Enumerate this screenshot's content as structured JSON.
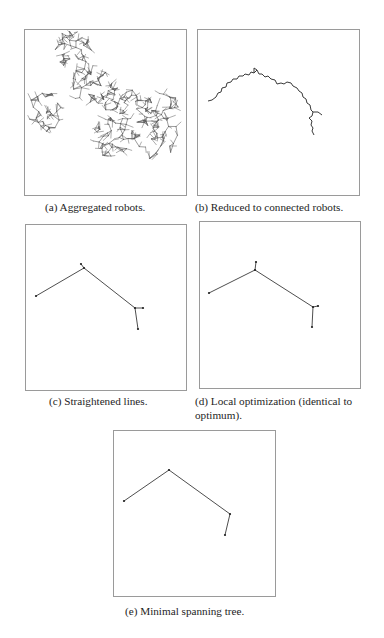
{
  "figure": {
    "panels": [
      {
        "id": "a",
        "caption": "(a) Aggregated robots.",
        "box": {
          "x": 24,
          "y": 29,
          "w": 163,
          "h": 167
        },
        "caption_pos": {
          "x": 45,
          "y": 200
        },
        "network": {
          "seed": 7,
          "clusters": [
            {
              "cx": 72,
              "cy": 50,
              "rx": 20,
              "ry": 20,
              "n": 45
            },
            {
              "cx": 90,
              "cy": 85,
              "rx": 22,
              "ry": 20,
              "n": 50
            },
            {
              "cx": 45,
              "cy": 112,
              "rx": 18,
              "ry": 20,
              "n": 38
            },
            {
              "cx": 120,
              "cy": 105,
              "rx": 22,
              "ry": 18,
              "n": 45
            },
            {
              "cx": 150,
              "cy": 135,
              "rx": 30,
              "ry": 25,
              "n": 70
            },
            {
              "cx": 110,
              "cy": 140,
              "rx": 18,
              "ry": 22,
              "n": 38
            },
            {
              "cx": 160,
              "cy": 105,
              "rx": 20,
              "ry": 12,
              "n": 25
            }
          ]
        }
      },
      {
        "id": "b",
        "caption": "(b) Reduced to connected robots.",
        "box": {
          "x": 197,
          "y": 29,
          "w": 163,
          "h": 167
        },
        "caption_pos": {
          "x": 195,
          "y": 200
        },
        "path": [
          [
            208,
            101
          ],
          [
            212,
            100
          ],
          [
            216,
            97
          ],
          [
            218,
            93
          ],
          [
            221,
            92
          ],
          [
            222,
            88
          ],
          [
            226,
            87
          ],
          [
            227,
            83
          ],
          [
            231,
            82
          ],
          [
            233,
            79
          ],
          [
            237,
            79
          ],
          [
            239,
            76
          ],
          [
            243,
            76
          ],
          [
            245,
            74
          ],
          [
            249,
            75
          ],
          [
            251,
            72
          ],
          [
            254,
            73
          ],
          [
            257,
            70
          ],
          [
            259,
            74
          ],
          [
            262,
            74
          ],
          [
            265,
            77
          ],
          [
            268,
            76
          ],
          [
            271,
            79
          ],
          [
            275,
            80
          ],
          [
            277,
            84
          ],
          [
            281,
            83
          ],
          [
            284,
            84
          ],
          [
            287,
            82
          ],
          [
            291,
            83
          ],
          [
            293,
            86
          ],
          [
            297,
            88
          ],
          [
            299,
            91
          ],
          [
            302,
            93
          ],
          [
            303,
            97
          ],
          [
            306,
            99
          ],
          [
            307,
            103
          ],
          [
            310,
            105
          ],
          [
            311,
            110
          ],
          [
            313,
            112
          ],
          [
            312,
            116
          ],
          [
            309,
            118
          ],
          [
            312,
            121
          ],
          [
            311,
            125
          ],
          [
            313,
            128
          ],
          [
            312,
            131
          ],
          [
            314,
            135
          ]
        ],
        "branches": [
          [
            [
              254,
              73
            ],
            [
              254,
              68
            ],
            [
              257,
              70
            ]
          ],
          [
            [
              313,
              112
            ],
            [
              318,
              112
            ],
            [
              322,
              115
            ]
          ]
        ]
      },
      {
        "id": "c",
        "caption": "(c) Straightened lines.",
        "box": {
          "x": 25,
          "y": 224,
          "w": 162,
          "h": 167
        },
        "caption_pos": {
          "x": 49,
          "y": 394
        },
        "edges": [
          [
            [
              36,
              296
            ],
            [
              84,
              268
            ]
          ],
          [
            [
              81,
              264
            ],
            [
              84,
              268
            ]
          ],
          [
            [
              84,
              268
            ],
            [
              135,
              308
            ]
          ],
          [
            [
              135,
              308
            ],
            [
              143,
              308
            ]
          ],
          [
            [
              135,
              308
            ],
            [
              138,
              329
            ]
          ]
        ],
        "nodes": [
          [
            36,
            296
          ],
          [
            81,
            264
          ],
          [
            84,
            268
          ],
          [
            135,
            308
          ],
          [
            143,
            308
          ],
          [
            138,
            329
          ]
        ]
      },
      {
        "id": "d",
        "caption": "(d) Local optimization (identical to optimum).",
        "box": {
          "x": 199,
          "y": 221,
          "w": 162,
          "h": 168
        },
        "caption_pos": {
          "x": 195,
          "y": 394
        },
        "edges": [
          [
            [
              209,
              293
            ],
            [
              255,
              270
            ]
          ],
          [
            [
              255,
              270
            ],
            [
              256,
              262
            ]
          ],
          [
            [
              255,
              270
            ],
            [
              313,
              307
            ]
          ],
          [
            [
              313,
              307
            ],
            [
              318,
              306
            ]
          ],
          [
            [
              313,
              307
            ],
            [
              312,
              327
            ]
          ]
        ],
        "nodes": [
          [
            209,
            293
          ],
          [
            256,
            262
          ],
          [
            255,
            270
          ],
          [
            313,
            307
          ],
          [
            318,
            306
          ],
          [
            312,
            327
          ]
        ]
      },
      {
        "id": "e",
        "caption": "(e) Minimal spanning tree.",
        "box": {
          "x": 113,
          "y": 430,
          "w": 163,
          "h": 167
        },
        "caption_pos": {
          "x": 125,
          "y": 604
        },
        "edges": [
          [
            [
              124,
              501
            ],
            [
              169,
              470
            ]
          ],
          [
            [
              169,
              470
            ],
            [
              230,
              514
            ]
          ],
          [
            [
              230,
              514
            ],
            [
              225,
              535
            ]
          ]
        ],
        "nodes": [
          [
            124,
            501
          ],
          [
            169,
            470
          ],
          [
            230,
            514
          ],
          [
            225,
            535
          ]
        ]
      }
    ],
    "colors": {
      "frame": "#9a9a9a",
      "line": "#3a3a3a",
      "node": "#222222",
      "network": "#5a5a5a"
    }
  }
}
